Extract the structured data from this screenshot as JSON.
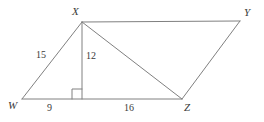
{
  "figure": {
    "background_color": "#ffffff",
    "stroke_color": "#808080",
    "label_color": "#3a3a3a",
    "vertices": [
      {
        "id": "W",
        "label": "W",
        "x": 22,
        "y": 99,
        "label_x": 8,
        "label_y": 100
      },
      {
        "id": "X",
        "label": "X",
        "x": 82,
        "y": 22,
        "label_x": 72,
        "label_y": 6
      },
      {
        "id": "Y",
        "label": "Y",
        "x": 240,
        "y": 21,
        "label_x": 244,
        "label_y": 7
      },
      {
        "id": "Z",
        "label": "Z",
        "x": 182,
        "y": 99,
        "label_x": 184,
        "label_y": 102
      }
    ],
    "foot_of_altitude": {
      "id": "F",
      "x": 82,
      "y": 99
    },
    "segments": [
      {
        "name": "segment-wx",
        "from": "W",
        "to": "X"
      },
      {
        "name": "segment-xy",
        "from": "X",
        "to": "Y"
      },
      {
        "name": "segment-yz",
        "from": "Y",
        "to": "Z"
      },
      {
        "name": "segment-wz",
        "from": "W",
        "to": "Z"
      },
      {
        "name": "segment-xz",
        "from": "X",
        "to": "Z"
      },
      {
        "name": "segment-altitude-xf",
        "from": "X",
        "to": "F"
      }
    ],
    "right_angle_marker": {
      "x": 72,
      "y": 89,
      "size": 10,
      "at_vertex": "F"
    },
    "measures": [
      {
        "name": "measure-wx",
        "value": "15",
        "segment": "WX",
        "x": 36,
        "y": 50
      },
      {
        "name": "measure-altitude",
        "value": "12",
        "segment": "XF",
        "x": 86,
        "y": 51
      },
      {
        "name": "measure-wf",
        "value": "9",
        "segment": "WF",
        "x": 47,
        "y": 103
      },
      {
        "name": "measure-fz",
        "value": "16",
        "segment": "FZ",
        "x": 124,
        "y": 103
      }
    ]
  }
}
